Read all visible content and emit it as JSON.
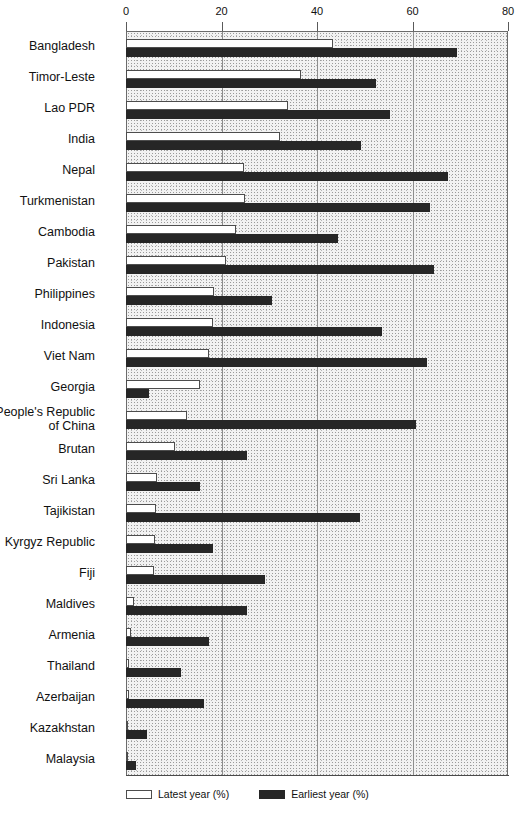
{
  "chart_data": {
    "type": "bar",
    "orientation": "horizontal",
    "title": "",
    "xlabel": "",
    "ylabel": "",
    "xlim": [
      0,
      80
    ],
    "xticks": [
      0,
      20,
      40,
      60,
      80
    ],
    "xtick_labels": [
      "0",
      "20",
      "40",
      "60",
      "80"
    ],
    "grid": true,
    "legend_position": "bottom-left",
    "categories": [
      "Bangladesh",
      "Timor-Leste",
      "Lao PDR",
      "India",
      "Nepal",
      "Turkmenistan",
      "Cambodia",
      "Pakistan",
      "Philippines",
      "Indonesia",
      "Viet Nam",
      "Georgia",
      "People's Republic\nof China",
      "Brutan",
      "Sri Lanka",
      "Tajikistan",
      "Kyrgyz Republic",
      "Fiji",
      "Maldives",
      "Armenia",
      "Thailand",
      "Azerbaijan",
      "Kazakhstan",
      "Malaysia"
    ],
    "series": [
      {
        "name": "Latest year (%)",
        "color": "#ffffff",
        "values": [
          43.3,
          36.6,
          33.9,
          32.3,
          24.8,
          24.9,
          23.0,
          20.9,
          18.5,
          18.2,
          17.3,
          15.5,
          12.8,
          10.3,
          6.5,
          6.3,
          6.1,
          5.9,
          1.7,
          1.0,
          0.7,
          0.6,
          0.2,
          0.2
        ]
      },
      {
        "name": "Earliest year (%)",
        "color": "#262626",
        "values": [
          69.4,
          52.4,
          55.3,
          49.2,
          67.5,
          63.7,
          44.4,
          64.4,
          30.5,
          53.6,
          63.0,
          4.8,
          60.7,
          25.3,
          15.5,
          49.0,
          18.3,
          29.1,
          25.3,
          17.4,
          11.6,
          16.4,
          4.3,
          2.1
        ]
      }
    ]
  },
  "legend": {
    "items": [
      {
        "label": "Latest year (%)",
        "swatch": "white-box"
      },
      {
        "label": "Earliest year (%)",
        "swatch": "black-box"
      }
    ]
  }
}
